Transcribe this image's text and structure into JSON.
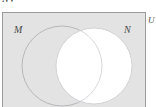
{
  "figure": {
    "type": "venn-diagram",
    "caption_fragment": "NV",
    "background_color": "#ffffff",
    "universe": {
      "label": "U",
      "label_position": "outside-top-right",
      "border_color": "#9a9a9a",
      "fill_color": "#e2e2e2",
      "shaded": true
    },
    "sets": [
      {
        "name": "M",
        "label": "M",
        "label_position": "inside-top-left",
        "side": "left",
        "fill_color": "#e2e2e2",
        "shaded": true,
        "outline_color": "#b0aeb4"
      },
      {
        "name": "N",
        "label": "N",
        "label_position": "inside-top-right",
        "side": "right",
        "fill_color": "#ffffff",
        "shaded": false,
        "outline_color": "#cfcdd2"
      }
    ],
    "regions": [
      {
        "name": "M-only",
        "description": "M minus N",
        "shaded": true
      },
      {
        "name": "M-intersect-N",
        "description": "M and N",
        "shaded": false
      },
      {
        "name": "N-only",
        "description": "N minus M",
        "shaded": false
      },
      {
        "name": "outside-both",
        "description": "U minus (M union N)",
        "shaded": true
      }
    ],
    "shaded_expression": "N'"
  }
}
